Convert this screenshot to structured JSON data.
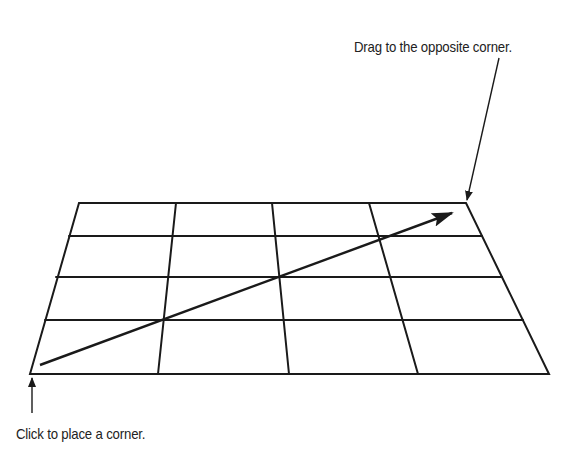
{
  "diagram": {
    "type": "grid-drawing-instruction",
    "annotations": {
      "drag": "Drag to the opposite corner.",
      "click": "Click to place a corner."
    },
    "grid": {
      "rows": 4,
      "columns": 4,
      "shape": "perspective-trapezoid",
      "corners": {
        "top_left": [
          79,
          203
        ],
        "top_right": [
          466,
          203
        ],
        "bottom_right": [
          549,
          374
        ],
        "bottom_left": [
          30,
          374
        ]
      }
    },
    "arrow": {
      "from": [
        40,
        365
      ],
      "to": [
        450,
        213
      ],
      "meaning": "drag direction from first corner to opposite corner"
    },
    "colors": {
      "line": "#1a1a1a",
      "background": "#ffffff",
      "text": "#222222"
    }
  }
}
